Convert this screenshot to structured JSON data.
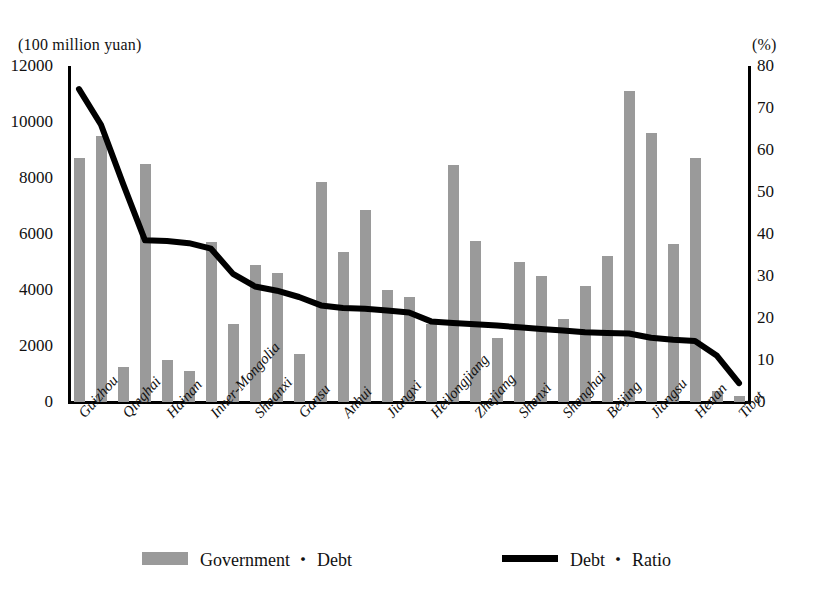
{
  "chart_data": {
    "type": "bar",
    "title": "",
    "xlabel": "",
    "ylabel": "(100 million yuan)",
    "y2label": "(%)",
    "left_unit": "(100 million yuan)",
    "right_unit": "(%)",
    "ylim": [
      0,
      12000
    ],
    "y2lim": [
      0,
      80
    ],
    "yticks": [
      0,
      2000,
      4000,
      6000,
      8000,
      10000,
      12000
    ],
    "y2ticks": [
      0,
      10,
      20,
      30,
      40,
      50,
      60,
      70,
      80
    ],
    "grid": false,
    "legend_position": "bottom",
    "bar_color": "#9a9a9a",
    "line_color": "#000000",
    "categories": [
      "Guizhou",
      "",
      "Qinghai",
      "",
      "Hainan",
      "",
      "Inner-Mongolia",
      "",
      "Shaanxi",
      "",
      "Gansu",
      "",
      "Anhui",
      "",
      "Jiangxi",
      "",
      "Heilongjiang",
      "",
      "Zhejiang",
      "",
      "Shanxi",
      "",
      "Shanghai",
      "",
      "Beijing",
      "",
      "Jiangsu",
      "",
      "Henan",
      "",
      "Tibet"
    ],
    "tick_labels": [
      "Guizhou",
      "Qinghai",
      "Hainan",
      "Inner-Mongolia",
      "Shaanxi",
      "Gansu",
      "Anhui",
      "Jiangxi",
      "Heilongjiang",
      "Zhejiang",
      "Shanxi",
      "Shanghai",
      "Beijing",
      "Jiangsu",
      "Henan",
      "Tibet"
    ],
    "series": [
      {
        "name": "Government ・ Debt",
        "type": "bar",
        "axis": "left",
        "values": [
          8700,
          9500,
          1250,
          8500,
          1500,
          1100,
          5700,
          2800,
          4900,
          4600,
          1700,
          7850,
          5350,
          6850,
          4000,
          3750,
          2800,
          8450,
          5750,
          2300,
          5000,
          4500,
          2950,
          4150,
          5200,
          11100,
          9600,
          5650,
          8700,
          400,
          200
        ]
      },
      {
        "name": "Debt ・ Ratio",
        "type": "line",
        "axis": "right",
        "values": [
          74.5,
          66.0,
          52.0,
          38.5,
          38.3,
          37.8,
          36.5,
          30.5,
          27.5,
          26.5,
          25.0,
          23.0,
          22.4,
          22.2,
          21.8,
          21.3,
          19.2,
          18.8,
          18.5,
          18.2,
          17.8,
          17.4,
          17.0,
          16.6,
          16.4,
          16.3,
          15.3,
          14.8,
          14.5,
          11.0,
          4.5
        ]
      }
    ]
  },
  "legend": {
    "bar_label": "Government ・ Debt",
    "line_label": "Debt ・ Ratio"
  }
}
